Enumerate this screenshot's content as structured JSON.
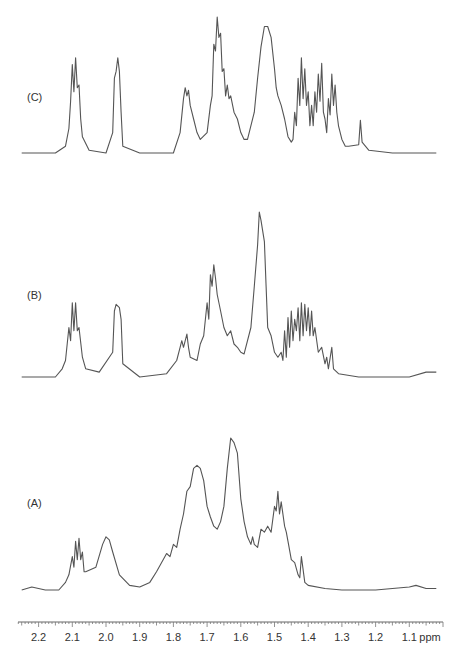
{
  "chart_data": {
    "type": "line",
    "title": "",
    "xlabel": "ppm",
    "ylabel": "",
    "x_axis": {
      "range": [
        2.25,
        1.02
      ],
      "reversed": true,
      "ticks": [
        2.2,
        2.1,
        2.0,
        1.9,
        1.8,
        1.7,
        1.6,
        1.5,
        1.4,
        1.3,
        1.2,
        1.1
      ],
      "tick_labels": [
        "2.2",
        "2.1",
        "2.0",
        "1.9",
        "1.8",
        "1.7",
        "1.6",
        "1.5",
        "1.4",
        "1.3",
        "1.2",
        "1.1"
      ],
      "minor_ticks_per_major": 10
    },
    "grid": false,
    "legend": null,
    "series": [
      {
        "name": "(C)",
        "label": "(C)",
        "description": "Highest-resolution spectrum, stacked top",
        "points": [
          [
            2.25,
            0.0
          ],
          [
            2.15,
            0.0
          ],
          [
            2.12,
            0.05
          ],
          [
            2.11,
            0.18
          ],
          [
            2.105,
            0.38
          ],
          [
            2.1,
            0.65
          ],
          [
            2.095,
            0.45
          ],
          [
            2.09,
            0.7
          ],
          [
            2.085,
            0.48
          ],
          [
            2.08,
            0.5
          ],
          [
            2.075,
            0.25
          ],
          [
            2.07,
            0.12
          ],
          [
            2.05,
            0.02
          ],
          [
            2.0,
            0.0
          ],
          [
            1.98,
            0.15
          ],
          [
            1.975,
            0.55
          ],
          [
            1.97,
            0.6
          ],
          [
            1.965,
            0.7
          ],
          [
            1.96,
            0.6
          ],
          [
            1.955,
            0.3
          ],
          [
            1.95,
            0.05
          ],
          [
            1.9,
            0.0
          ],
          [
            1.8,
            0.0
          ],
          [
            1.78,
            0.15
          ],
          [
            1.77,
            0.4
          ],
          [
            1.765,
            0.48
          ],
          [
            1.76,
            0.42
          ],
          [
            1.755,
            0.46
          ],
          [
            1.75,
            0.35
          ],
          [
            1.74,
            0.25
          ],
          [
            1.73,
            0.15
          ],
          [
            1.72,
            0.1
          ],
          [
            1.7,
            0.15
          ],
          [
            1.69,
            0.35
          ],
          [
            1.685,
            0.42
          ],
          [
            1.68,
            0.8
          ],
          [
            1.675,
            0.75
          ],
          [
            1.67,
            1.0
          ],
          [
            1.665,
            0.85
          ],
          [
            1.66,
            0.88
          ],
          [
            1.655,
            0.6
          ],
          [
            1.65,
            0.62
          ],
          [
            1.645,
            0.42
          ],
          [
            1.64,
            0.5
          ],
          [
            1.635,
            0.4
          ],
          [
            1.63,
            0.42
          ],
          [
            1.62,
            0.3
          ],
          [
            1.61,
            0.25
          ],
          [
            1.6,
            0.15
          ],
          [
            1.59,
            0.1
          ],
          [
            1.58,
            0.1
          ],
          [
            1.56,
            0.3
          ],
          [
            1.55,
            0.55
          ],
          [
            1.54,
            0.78
          ],
          [
            1.53,
            0.93
          ],
          [
            1.52,
            0.93
          ],
          [
            1.51,
            0.85
          ],
          [
            1.5,
            0.62
          ],
          [
            1.495,
            0.48
          ],
          [
            1.49,
            0.42
          ],
          [
            1.48,
            0.35
          ],
          [
            1.47,
            0.25
          ],
          [
            1.46,
            0.12
          ],
          [
            1.45,
            0.08
          ],
          [
            1.445,
            0.1
          ],
          [
            1.44,
            0.3
          ],
          [
            1.435,
            0.2
          ],
          [
            1.43,
            0.55
          ],
          [
            1.425,
            0.35
          ],
          [
            1.42,
            0.7
          ],
          [
            1.415,
            0.4
          ],
          [
            1.41,
            0.62
          ],
          [
            1.405,
            0.35
          ],
          [
            1.4,
            0.45
          ],
          [
            1.395,
            0.2
          ],
          [
            1.39,
            0.35
          ],
          [
            1.385,
            0.2
          ],
          [
            1.38,
            0.45
          ],
          [
            1.375,
            0.3
          ],
          [
            1.37,
            0.58
          ],
          [
            1.365,
            0.38
          ],
          [
            1.36,
            0.66
          ],
          [
            1.355,
            0.3
          ],
          [
            1.35,
            0.25
          ],
          [
            1.345,
            0.15
          ],
          [
            1.34,
            0.4
          ],
          [
            1.335,
            0.28
          ],
          [
            1.33,
            0.58
          ],
          [
            1.325,
            0.35
          ],
          [
            1.32,
            0.5
          ],
          [
            1.315,
            0.3
          ],
          [
            1.31,
            0.2
          ],
          [
            1.3,
            0.1
          ],
          [
            1.29,
            0.05
          ],
          [
            1.28,
            0.05
          ],
          [
            1.25,
            0.06
          ],
          [
            1.245,
            0.24
          ],
          [
            1.24,
            0.08
          ],
          [
            1.22,
            0.02
          ],
          [
            1.15,
            0.0
          ],
          [
            1.02,
            0.0
          ]
        ],
        "peak_max_ppm": 1.67
      },
      {
        "name": "(B)",
        "label": "(B)",
        "description": "Intermediate-resolution spectrum, stacked middle",
        "points": [
          [
            2.25,
            0.0
          ],
          [
            2.15,
            0.0
          ],
          [
            2.13,
            0.05
          ],
          [
            2.12,
            0.1
          ],
          [
            2.11,
            0.3
          ],
          [
            2.105,
            0.22
          ],
          [
            2.1,
            0.45
          ],
          [
            2.095,
            0.28
          ],
          [
            2.09,
            0.45
          ],
          [
            2.085,
            0.28
          ],
          [
            2.08,
            0.3
          ],
          [
            2.07,
            0.12
          ],
          [
            2.06,
            0.05
          ],
          [
            2.02,
            0.03
          ],
          [
            1.98,
            0.15
          ],
          [
            1.975,
            0.4
          ],
          [
            1.97,
            0.44
          ],
          [
            1.96,
            0.42
          ],
          [
            1.955,
            0.35
          ],
          [
            1.95,
            0.08
          ],
          [
            1.9,
            0.0
          ],
          [
            1.82,
            0.02
          ],
          [
            1.79,
            0.1
          ],
          [
            1.78,
            0.18
          ],
          [
            1.775,
            0.22
          ],
          [
            1.77,
            0.18
          ],
          [
            1.76,
            0.26
          ],
          [
            1.755,
            0.18
          ],
          [
            1.75,
            0.12
          ],
          [
            1.73,
            0.1
          ],
          [
            1.72,
            0.2
          ],
          [
            1.71,
            0.25
          ],
          [
            1.7,
            0.45
          ],
          [
            1.695,
            0.35
          ],
          [
            1.69,
            0.62
          ],
          [
            1.685,
            0.55
          ],
          [
            1.68,
            0.68
          ],
          [
            1.675,
            0.6
          ],
          [
            1.67,
            0.5
          ],
          [
            1.66,
            0.4
          ],
          [
            1.65,
            0.3
          ],
          [
            1.64,
            0.25
          ],
          [
            1.63,
            0.28
          ],
          [
            1.62,
            0.2
          ],
          [
            1.61,
            0.18
          ],
          [
            1.6,
            0.15
          ],
          [
            1.59,
            0.14
          ],
          [
            1.57,
            0.3
          ],
          [
            1.56,
            0.55
          ],
          [
            1.55,
            0.8
          ],
          [
            1.545,
            1.0
          ],
          [
            1.54,
            0.95
          ],
          [
            1.53,
            0.82
          ],
          [
            1.525,
            0.55
          ],
          [
            1.52,
            0.3
          ],
          [
            1.51,
            0.25
          ],
          [
            1.5,
            0.15
          ],
          [
            1.49,
            0.12
          ],
          [
            1.48,
            0.15
          ],
          [
            1.475,
            0.1
          ],
          [
            1.47,
            0.28
          ],
          [
            1.465,
            0.12
          ],
          [
            1.46,
            0.36
          ],
          [
            1.455,
            0.18
          ],
          [
            1.45,
            0.4
          ],
          [
            1.445,
            0.22
          ],
          [
            1.44,
            0.35
          ],
          [
            1.435,
            0.28
          ],
          [
            1.43,
            0.42
          ],
          [
            1.425,
            0.22
          ],
          [
            1.42,
            0.45
          ],
          [
            1.415,
            0.25
          ],
          [
            1.41,
            0.44
          ],
          [
            1.405,
            0.28
          ],
          [
            1.4,
            0.42
          ],
          [
            1.395,
            0.25
          ],
          [
            1.39,
            0.4
          ],
          [
            1.385,
            0.25
          ],
          [
            1.38,
            0.3
          ],
          [
            1.37,
            0.15
          ],
          [
            1.36,
            0.18
          ],
          [
            1.35,
            0.08
          ],
          [
            1.345,
            0.12
          ],
          [
            1.34,
            0.05
          ],
          [
            1.33,
            0.18
          ],
          [
            1.325,
            0.05
          ],
          [
            1.31,
            0.02
          ],
          [
            1.25,
            0.0
          ],
          [
            1.1,
            0.0
          ],
          [
            1.05,
            0.03
          ],
          [
            1.02,
            0.03
          ]
        ],
        "peak_max_ppm": 1.545
      },
      {
        "name": "(A)",
        "label": "(A)",
        "description": "Lowest-resolution spectrum, stacked bottom",
        "points": [
          [
            2.25,
            0.0
          ],
          [
            2.22,
            0.02
          ],
          [
            2.18,
            0.0
          ],
          [
            2.14,
            0.0
          ],
          [
            2.12,
            0.05
          ],
          [
            2.11,
            0.1
          ],
          [
            2.1,
            0.22
          ],
          [
            2.095,
            0.15
          ],
          [
            2.09,
            0.32
          ],
          [
            2.085,
            0.2
          ],
          [
            2.08,
            0.34
          ],
          [
            2.075,
            0.2
          ],
          [
            2.07,
            0.25
          ],
          [
            2.065,
            0.12
          ],
          [
            2.06,
            0.12
          ],
          [
            2.03,
            0.15
          ],
          [
            2.01,
            0.3
          ],
          [
            2.0,
            0.35
          ],
          [
            1.99,
            0.33
          ],
          [
            1.98,
            0.25
          ],
          [
            1.96,
            0.1
          ],
          [
            1.93,
            0.03
          ],
          [
            1.9,
            0.02
          ],
          [
            1.87,
            0.05
          ],
          [
            1.85,
            0.12
          ],
          [
            1.83,
            0.2
          ],
          [
            1.82,
            0.24
          ],
          [
            1.81,
            0.22
          ],
          [
            1.8,
            0.3
          ],
          [
            1.79,
            0.28
          ],
          [
            1.78,
            0.4
          ],
          [
            1.77,
            0.5
          ],
          [
            1.76,
            0.65
          ],
          [
            1.75,
            0.68
          ],
          [
            1.74,
            0.8
          ],
          [
            1.73,
            0.82
          ],
          [
            1.72,
            0.8
          ],
          [
            1.71,
            0.72
          ],
          [
            1.7,
            0.55
          ],
          [
            1.69,
            0.48
          ],
          [
            1.68,
            0.42
          ],
          [
            1.67,
            0.4
          ],
          [
            1.66,
            0.45
          ],
          [
            1.65,
            0.55
          ],
          [
            1.64,
            0.8
          ],
          [
            1.63,
            1.0
          ],
          [
            1.62,
            0.97
          ],
          [
            1.61,
            0.9
          ],
          [
            1.6,
            0.6
          ],
          [
            1.59,
            0.45
          ],
          [
            1.58,
            0.35
          ],
          [
            1.57,
            0.3
          ],
          [
            1.565,
            0.35
          ],
          [
            1.56,
            0.3
          ],
          [
            1.55,
            0.28
          ],
          [
            1.54,
            0.4
          ],
          [
            1.53,
            0.38
          ],
          [
            1.52,
            0.42
          ],
          [
            1.51,
            0.38
          ],
          [
            1.5,
            0.55
          ],
          [
            1.495,
            0.52
          ],
          [
            1.49,
            0.65
          ],
          [
            1.485,
            0.5
          ],
          [
            1.48,
            0.58
          ],
          [
            1.47,
            0.42
          ],
          [
            1.465,
            0.38
          ],
          [
            1.46,
            0.32
          ],
          [
            1.45,
            0.2
          ],
          [
            1.44,
            0.18
          ],
          [
            1.43,
            0.1
          ],
          [
            1.425,
            0.08
          ],
          [
            1.42,
            0.22
          ],
          [
            1.41,
            0.05
          ],
          [
            1.4,
            0.03
          ],
          [
            1.35,
            0.01
          ],
          [
            1.3,
            0.0
          ],
          [
            1.2,
            0.0
          ],
          [
            1.1,
            0.02
          ],
          [
            1.08,
            0.03
          ],
          [
            1.05,
            0.01
          ],
          [
            1.02,
            0.01
          ]
        ],
        "peak_max_ppm": 1.5
      }
    ],
    "stack_order_top_to_bottom": [
      "(C)",
      "(B)",
      "(A)"
    ]
  },
  "labels": {
    "series_c": "(C)",
    "series_b": "(B)",
    "series_a": "(A)",
    "unit": "ppm"
  },
  "layout": {
    "axis": {
      "x_left_px": 18,
      "x_right_px": 443,
      "y_px": 622,
      "ppm_left": 2.261,
      "ppm_right": 1.0
    },
    "traces": [
      {
        "key": "C",
        "baseline_px": 153,
        "height_px": 136,
        "label_x": 27,
        "label_y": 101
      },
      {
        "key": "B",
        "baseline_px": 377,
        "height_px": 165,
        "label_x": 27,
        "label_y": 299
      },
      {
        "key": "A",
        "baseline_px": 590,
        "height_px": 152,
        "label_x": 27,
        "label_y": 507
      }
    ],
    "colors": {
      "trace": "#555555",
      "axis": "#666666",
      "text": "#333333"
    }
  }
}
